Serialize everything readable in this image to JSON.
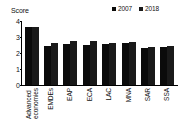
{
  "chart_data": {
    "type": "bar",
    "title": "",
    "ylabel": "Score",
    "xlabel": "",
    "ylim": [
      0,
      4
    ],
    "yticks": [
      "0",
      "1",
      "2",
      "3",
      "4"
    ],
    "grid": false,
    "legend_position": "top-right",
    "categories": [
      "Advanced economies",
      "EMDEs",
      "EAP",
      "ECA",
      "LAC",
      "MNA",
      "SAR",
      "SSA"
    ],
    "category_lines": [
      [
        "Advanced",
        "economies"
      ],
      [
        "EMDEs"
      ],
      [
        "EAP"
      ],
      [
        "ECA"
      ],
      [
        "LAC"
      ],
      [
        "MNA"
      ],
      [
        "SAR"
      ],
      [
        "SSA"
      ]
    ],
    "series": [
      {
        "name": "2007",
        "color": "#0b0b0b",
        "values": [
          3.6,
          2.45,
          2.55,
          2.5,
          2.55,
          2.6,
          2.3,
          2.35
        ]
      },
      {
        "name": "2018",
        "color": "#1a1a1a",
        "values": [
          3.65,
          2.6,
          2.75,
          2.75,
          2.65,
          2.7,
          2.4,
          2.45
        ]
      }
    ]
  }
}
